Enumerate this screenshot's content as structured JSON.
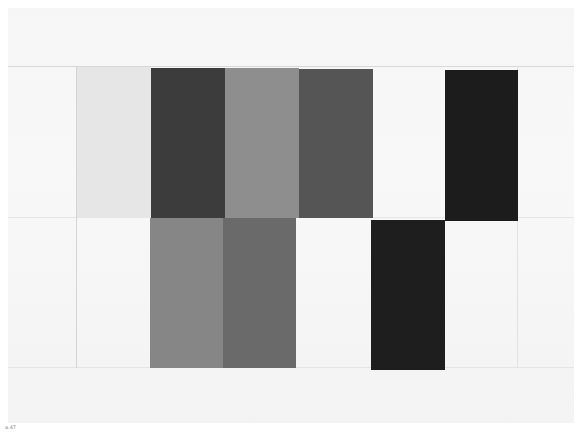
{
  "artwork": {
    "description": "Photograph of a grid-based grayscale panel painting",
    "background_color": "#f6f6f6",
    "panels": [
      {
        "name": "light-panel-top-left",
        "x": 77,
        "y": 67,
        "w": 74,
        "h": 150,
        "color": "#e6e6e6"
      },
      {
        "name": "dark-gray-panel-top",
        "x": 151,
        "y": 68,
        "w": 74,
        "h": 150,
        "color": "#3c3c3c"
      },
      {
        "name": "mid-gray-panel-top",
        "x": 225,
        "y": 68,
        "w": 74,
        "h": 150,
        "color": "#8e8e8e"
      },
      {
        "name": "charcoal-panel-top",
        "x": 299,
        "y": 69,
        "w": 74,
        "h": 149,
        "color": "#555555"
      },
      {
        "name": "black-panel-top-right",
        "x": 445,
        "y": 70,
        "w": 73,
        "h": 151,
        "color": "#1c1c1c"
      },
      {
        "name": "gray-panel-bottom-left",
        "x": 150,
        "y": 218,
        "w": 74,
        "h": 150,
        "color": "#868686"
      },
      {
        "name": "slate-panel-bottom",
        "x": 223,
        "y": 218,
        "w": 73,
        "h": 150,
        "color": "#6a6a6a"
      },
      {
        "name": "black-panel-bottom",
        "x": 371,
        "y": 220,
        "w": 74,
        "h": 150,
        "color": "#1e1e1e"
      }
    ]
  },
  "caption": "a.47"
}
